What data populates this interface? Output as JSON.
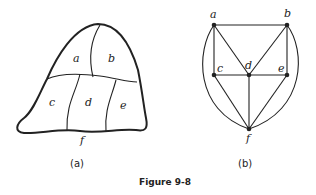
{
  "figure": {
    "title": "Figure 9-8",
    "panels": [
      {
        "id": "a",
        "caption": "(a)",
        "type": "map",
        "regions": [
          "a",
          "b",
          "c",
          "d",
          "e",
          "f"
        ],
        "labels": {
          "a": "a",
          "b": "b",
          "c": "c",
          "d": "d",
          "e": "e",
          "f": "f"
        }
      },
      {
        "id": "b",
        "caption": "(b)",
        "type": "graph",
        "vertices": [
          "a",
          "b",
          "c",
          "d",
          "e",
          "f"
        ],
        "labels": {
          "a": "a",
          "b": "b",
          "c": "c",
          "d": "d",
          "e": "e",
          "f": "f"
        },
        "edges": [
          [
            "a",
            "b"
          ],
          [
            "a",
            "c"
          ],
          [
            "a",
            "d"
          ],
          [
            "b",
            "d"
          ],
          [
            "b",
            "e"
          ],
          [
            "c",
            "d"
          ],
          [
            "d",
            "e"
          ],
          [
            "c",
            "f"
          ],
          [
            "d",
            "f"
          ],
          [
            "e",
            "f"
          ],
          [
            "a",
            "f"
          ],
          [
            "b",
            "f"
          ]
        ]
      }
    ]
  },
  "colors": {
    "ink": "#222222",
    "background": "#ffffff"
  }
}
